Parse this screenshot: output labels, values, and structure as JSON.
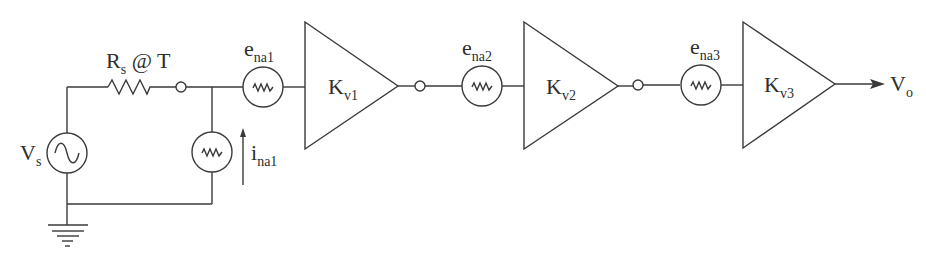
{
  "diagram": {
    "source": {
      "label": "V",
      "sub": "s",
      "icon": "ac-source-icon"
    },
    "resistor": {
      "label": "R",
      "sub": "s",
      "suffix": " @ T",
      "icon": "resistor-icon"
    },
    "current_noise": {
      "label": "i",
      "sub": "na1",
      "icon": "noise-source-icon"
    },
    "stages": [
      {
        "noise_label": "e",
        "noise_sub": "na1",
        "gain_label": "K",
        "gain_sub": "v1"
      },
      {
        "noise_label": "e",
        "noise_sub": "na2",
        "gain_label": "K",
        "gain_sub": "v2"
      },
      {
        "noise_label": "e",
        "noise_sub": "na3",
        "gain_label": "K",
        "gain_sub": "v3"
      }
    ],
    "output": {
      "label": "V",
      "sub": "o"
    },
    "ground": {
      "icon": "ground-icon"
    }
  }
}
